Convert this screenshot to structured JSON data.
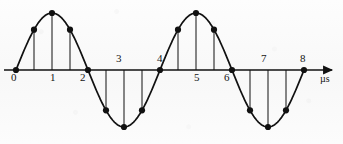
{
  "figure": {
    "name": "sampled-sine-wave-diagram",
    "background_color": "#fbfbfb",
    "ink_color": "#111111"
  },
  "axis": {
    "unit_label": "µs",
    "y_pixel": 70,
    "x_start_pixel": 4,
    "x_end_pixel": 338,
    "arrow": true,
    "tick_labels": [
      {
        "text": "0",
        "value": 0,
        "x": 11,
        "y": 72,
        "position": "below"
      },
      {
        "text": "1",
        "value": 1,
        "x": 50,
        "y": 72,
        "position": "below"
      },
      {
        "text": "2",
        "value": 2,
        "x": 80,
        "y": 72,
        "position": "below"
      },
      {
        "text": "3",
        "value": 3,
        "x": 116,
        "y": 53,
        "position": "above"
      },
      {
        "text": "4",
        "value": 4,
        "x": 157,
        "y": 53,
        "position": "above"
      },
      {
        "text": "5",
        "value": 5,
        "x": 194,
        "y": 72,
        "position": "below"
      },
      {
        "text": "6",
        "value": 6,
        "x": 224,
        "y": 72,
        "position": "below"
      },
      {
        "text": "7",
        "value": 7,
        "x": 261,
        "y": 53,
        "position": "above"
      },
      {
        "text": "8",
        "value": 8,
        "x": 300,
        "y": 53,
        "position": "above"
      }
    ]
  },
  "chart_data": {
    "type": "line",
    "title": "",
    "xlabel": "µs",
    "ylabel": "",
    "xlim": [
      0,
      8.6
    ],
    "ylim": [
      -1.15,
      1.15
    ],
    "grid": false,
    "legend": null,
    "annotations": [],
    "series": [
      {
        "name": "sine-wave",
        "kind": "continuous-curve",
        "period_us": 4,
        "amplitude": 1,
        "phase": 0,
        "x_range": [
          0,
          8
        ]
      },
      {
        "name": "samples",
        "kind": "stem-markers",
        "sample_interval_us": 0.5,
        "marker": "filled-circle",
        "x": [
          0,
          0.5,
          1,
          1.5,
          2,
          2.5,
          3,
          3.5,
          4,
          4.5,
          5,
          5.5,
          6,
          6.5,
          7,
          7.5,
          8
        ],
        "y": [
          0,
          0.707,
          1,
          0.707,
          0,
          -0.707,
          -1,
          -0.707,
          0,
          0.707,
          1,
          0.707,
          0,
          -0.707,
          -1,
          -0.707,
          0
        ]
      }
    ]
  }
}
